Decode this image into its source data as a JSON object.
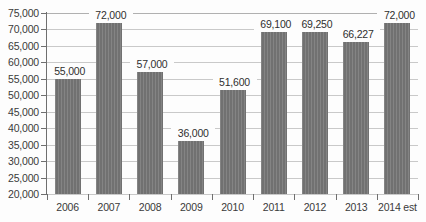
{
  "chart_data": {
    "type": "bar",
    "title": "",
    "subtitle": "",
    "xlabel": "",
    "ylabel": "",
    "categories": [
      "2006",
      "2007",
      "2008",
      "2009",
      "2010",
      "2011",
      "2012",
      "2013",
      "2014 est"
    ],
    "values": [
      55000,
      72000,
      57000,
      36000,
      51600,
      69100,
      69250,
      66227,
      72000
    ],
    "value_labels": [
      "55,000",
      "72,000",
      "57,000",
      "36,000",
      "51,600",
      "69,100",
      "69,250",
      "66,227",
      "72,000"
    ],
    "ylim": [
      20000,
      75000
    ],
    "ytick_step": 5000,
    "ytick_labels": [
      "75,000",
      "70,000",
      "65,000",
      "60,000",
      "55,000",
      "50,000",
      "45,000",
      "40,000",
      "35,000",
      "30,000",
      "25,000",
      "20,000"
    ],
    "ytick_values": [
      75000,
      70000,
      65000,
      60000,
      55000,
      50000,
      45000,
      40000,
      35000,
      30000,
      25000,
      20000
    ],
    "grid": true,
    "legend": false,
    "legend_position": "none",
    "series_name": "",
    "colors": {
      "bar_fill": "#767676",
      "gridline": "#c9c9c9",
      "axis_line": "#6f6f6f",
      "label_text": "#2f2f2f",
      "tick_text": "#3a3a3a",
      "background": "#fdfdfd"
    }
  }
}
